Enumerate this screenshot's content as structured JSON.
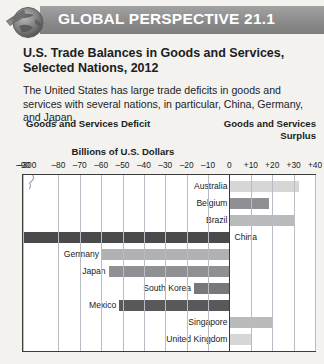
{
  "banner": {
    "label": "GLOBAL PERSPECTIVE 21.1",
    "icon": "globe-icon"
  },
  "headline": "U.S. Trade Balances in Goods and Services, Selected Nations, 2012",
  "subhead": "The United States has large trade deficits in goods and services with several nations, in particular, China, Germany, and Japan.",
  "chart_labels": {
    "deficit": "Goods and Services Deficit",
    "surplus_line1": "Goods and Services",
    "surplus_line2": "Surplus",
    "axis_title": "Billions of U.S. Dollars"
  },
  "chart_data": {
    "type": "bar",
    "orientation": "horizontal",
    "title": "U.S. Trade Balances in Goods and Services, Selected Nations, 2012",
    "xlabel": "Billions of U.S. Dollars",
    "ylabel": "",
    "grid": true,
    "legend": false,
    "axis_break": true,
    "axis_break_between": [
      -300,
      -90
    ],
    "tick_labels": [
      "–300",
      "–90",
      "–80",
      "–70",
      "–60",
      "–50",
      "–40",
      "–30",
      "–20",
      "–10",
      "0",
      "+10",
      "+20",
      "+30",
      "+40"
    ],
    "tick_values": [
      -300,
      -90,
      -80,
      -70,
      -60,
      -50,
      -40,
      -30,
      -20,
      -10,
      0,
      10,
      20,
      30,
      40
    ],
    "xlim": [
      -300,
      40
    ],
    "categories": [
      "Australia",
      "Belgium",
      "Brazil",
      "China",
      "Germany",
      "Japan",
      "South Korea",
      "Mexico",
      "Singapore",
      "United Kingdom"
    ],
    "values": [
      32,
      18,
      30,
      -315,
      -60,
      -57,
      -17,
      -52,
      20,
      10
    ],
    "bar_colors": [
      "#d6d6d6",
      "#8f9093",
      "#b9babc",
      "#4a4a4d",
      "#b0b1b4",
      "#8f9093",
      "#77787b",
      "#59595c",
      "#b9babc",
      "#d6d6d6"
    ]
  }
}
